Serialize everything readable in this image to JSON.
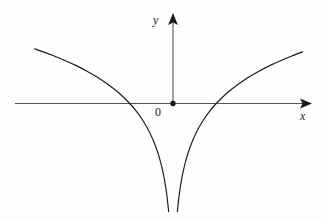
{
  "figure": {
    "kind": "cartesian-graph",
    "background_color": "#fefefe",
    "ink_color": "#1a1a1a",
    "axis_color": "#555555"
  },
  "labels": {
    "y_axis": "y",
    "x_axis": "x",
    "origin": "0"
  },
  "faint_background_text": {
    "line1": "",
    "line2": "",
    "line3": "",
    "line4": ""
  },
  "chart_data": {
    "type": "line",
    "title": "",
    "subtitle": "",
    "xlabel": "x",
    "ylabel": "y",
    "grid": false,
    "legend": null,
    "annotations": [
      {
        "text": "0",
        "x": 0,
        "y": 0,
        "role": "origin-label"
      }
    ],
    "markers": [
      {
        "name": "origin-dot",
        "x": 0,
        "y": 0,
        "shape": "filled-circle"
      }
    ],
    "axes": {
      "x_axis_arrow": true,
      "y_axis_arrow": true,
      "x_tick_labels": [],
      "y_tick_labels": [],
      "xlim": [
        -3.4,
        3.1
      ],
      "ylim": [
        -2.5,
        1.35
      ],
      "x_axis_drawn_range": [
        -3.45,
        3.05
      ],
      "y_axis_drawn_range": [
        0,
        1.35
      ]
    },
    "function": "y = ln|x|",
    "asymptote": {
      "type": "vertical",
      "x": 0
    },
    "x_intercepts": [
      -1,
      1
    ],
    "series": [
      {
        "name": "y = ln|x| (left branch, x < 0)",
        "x": [
          -3.2,
          -3.0,
          -2.75,
          -2.5,
          -2.25,
          -2.0,
          -1.75,
          -1.5,
          -1.25,
          -1.0,
          -0.85,
          -0.7,
          -0.55,
          -0.4,
          -0.3,
          -0.22,
          -0.15,
          -0.1,
          -0.06,
          -0.035,
          -0.02,
          -0.012
        ],
        "y": [
          1.163,
          1.099,
          1.012,
          0.916,
          0.811,
          0.693,
          0.56,
          0.405,
          0.223,
          0.0,
          -0.163,
          -0.357,
          -0.598,
          -0.916,
          -1.204,
          -1.514,
          -1.897,
          -2.303,
          -2.813,
          -3.352,
          -3.912,
          -4.423
        ]
      },
      {
        "name": "y = ln|x| (right branch, x > 0)",
        "x": [
          0.012,
          0.02,
          0.035,
          0.06,
          0.1,
          0.15,
          0.22,
          0.3,
          0.4,
          0.55,
          0.7,
          0.85,
          1.0,
          1.25,
          1.5,
          1.75,
          2.0,
          2.25,
          2.5,
          2.75,
          3.0,
          3.2
        ],
        "y": [
          -4.423,
          -3.912,
          -3.352,
          -2.813,
          -2.303,
          -1.897,
          -1.514,
          -1.204,
          -0.916,
          -0.598,
          -0.357,
          -0.163,
          0.0,
          0.223,
          0.405,
          0.56,
          0.693,
          0.811,
          0.916,
          1.012,
          1.099,
          1.163
        ]
      }
    ]
  }
}
